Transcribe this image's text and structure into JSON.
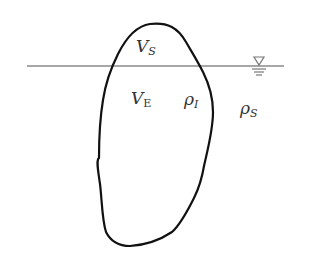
{
  "diagram": {
    "labels": {
      "submerged_volume": {
        "symbol": "V",
        "subscript": "S"
      },
      "emerged_volume": {
        "symbol": "V",
        "subscript": "E"
      },
      "ice_density": {
        "symbol": "ρ",
        "subscript": "I"
      },
      "water_density": {
        "symbol": "ρ",
        "subscript": "S"
      }
    },
    "water_surface_symbol": "water-level-icon",
    "colors": {
      "outline": "#111111",
      "waterline": "#8a8a8a",
      "text": "#333333"
    }
  }
}
